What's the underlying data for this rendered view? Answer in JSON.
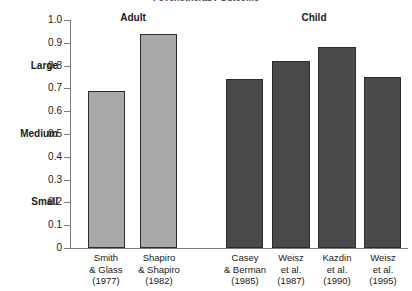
{
  "chart_data": {
    "type": "bar",
    "title": "Psychotherapy Outcome",
    "xlabel": "",
    "ylabel": "",
    "ylim": [
      0,
      1.0
    ],
    "grid": false,
    "legend_position": "none",
    "y_tick_labels": [
      "1.0",
      "0.9",
      "0.8",
      "0.7",
      "0.6",
      "0.5",
      "0.4",
      "0.3",
      "0.2",
      "0.1",
      "0"
    ],
    "y_tick_values": [
      1.0,
      0.9,
      0.8,
      0.7,
      0.6,
      0.5,
      0.4,
      0.3,
      0.2,
      0.1,
      0
    ],
    "effect_size_labels": [
      {
        "text": "Large",
        "value": 0.8
      },
      {
        "text": "Medium",
        "value": 0.5
      },
      {
        "text": "Small",
        "value": 0.2
      }
    ],
    "groups": [
      {
        "name": "Adult",
        "color": "#a8a8a8"
      },
      {
        "name": "Child",
        "color": "#4a4a4a"
      }
    ],
    "categories": [
      "Smith & Glass (1977)",
      "Shapiro & Shapiro (1982)",
      "Casey & Berman (1985)",
      "Weisz et al. (1987)",
      "Kazdin et al. (1990)",
      "Weisz et al. (1995)"
    ],
    "values": [
      0.69,
      0.94,
      0.74,
      0.82,
      0.88,
      0.75
    ],
    "bars": [
      {
        "group": "Adult",
        "line1": "Smith",
        "line2": "& Glass",
        "line3": "(1977)",
        "value": 0.69,
        "left": 88,
        "width": 37,
        "caption_left": 70,
        "caption_width": 72
      },
      {
        "group": "Adult",
        "line1": "Shapiro",
        "line2": "& Shapiro",
        "line3": "(1982)",
        "value": 0.94,
        "left": 140,
        "width": 37,
        "caption_left": 123,
        "caption_width": 72
      },
      {
        "group": "Child",
        "line1": "Casey",
        "line2": "& Berman",
        "line3": "(1985)",
        "value": 0.74,
        "left": 226,
        "width": 37,
        "caption_left": 209,
        "caption_width": 72
      },
      {
        "group": "Child",
        "line1": "Weisz",
        "line2": "et al.",
        "line3": "(1987)",
        "value": 0.82,
        "left": 272,
        "width": 38,
        "caption_left": 262,
        "caption_width": 58
      },
      {
        "group": "Child",
        "line1": "Kazdin",
        "line2": "et al.",
        "line3": "(1990)",
        "value": 0.88,
        "left": 318,
        "width": 38,
        "caption_left": 308,
        "caption_width": 58
      },
      {
        "group": "Child",
        "line1": "Weisz",
        "line2": "et al.",
        "line3": "(1995)",
        "value": 0.75,
        "left": 364,
        "width": 37,
        "caption_left": 354,
        "caption_width": 58
      }
    ],
    "group_headings": [
      {
        "label": "Adult",
        "center": 133
      },
      {
        "label": "Child",
        "center": 314
      }
    ]
  }
}
